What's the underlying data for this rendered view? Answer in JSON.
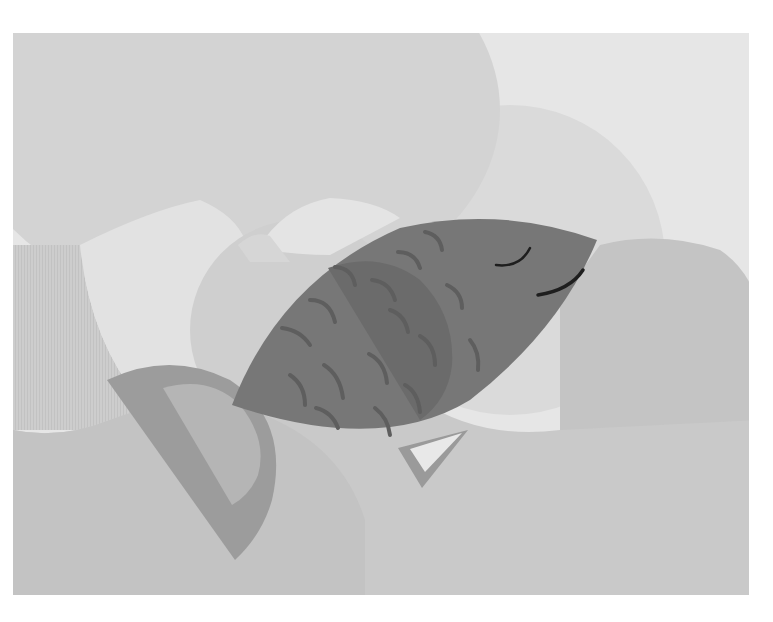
{
  "canvas": {
    "width": 773,
    "height": 622,
    "background": "#ffffff"
  },
  "frame": {
    "x": 13,
    "y": 33,
    "width": 736,
    "height": 562
  },
  "colors": {
    "frame_bg": "#e6e6e6",
    "big_circle_top": "#d3d3d3",
    "right_circle": "#d9d9d9",
    "left_light": "#e2e2e2",
    "left_striped": "#cccccc",
    "lower_left_blob": "#c6c6c6",
    "bottom_field": "#c9c9c9",
    "right_lobe": "#c4c4c4",
    "mid_circle": "#cfcfcf",
    "pale_tab": "#e4e4e4",
    "tail_outer": "#9c9c9c",
    "tail_inner": "#b5b5b5",
    "fin_outer": "#9a9a9a",
    "fin_inner": "#e8e8e8",
    "fish_body": "#777777",
    "fish_fin": "#6b6b6b",
    "scales": "#5e5e5e",
    "eye_mouth": "#1e1e1e"
  },
  "illustration": {
    "subject": "stylized fish",
    "elements": [
      "background-circles",
      "tail-fin",
      "body",
      "dorsal-fin",
      "scales",
      "eye",
      "mouth",
      "ventral-fin"
    ]
  }
}
